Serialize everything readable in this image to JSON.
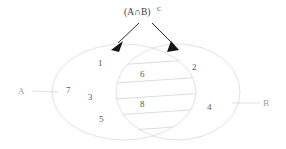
{
  "diagram": {
    "type": "venn-diagram",
    "title": {
      "base": "(A∩B)",
      "superscript": "C",
      "full": "(A∩B)ᶜ"
    },
    "set_labels": {
      "left": "A",
      "right": "B"
    },
    "regions": {
      "left_only": {
        "set": "A only",
        "numbers": [
          "1",
          "7",
          "3",
          "5"
        ]
      },
      "intersection": {
        "set": "A ∩ B",
        "shaded": "hatched",
        "numbers": [
          "6",
          "8"
        ]
      },
      "right_only": {
        "set": "B only",
        "numbers": [
          "2",
          "4"
        ]
      }
    },
    "numbers": [
      {
        "value": "1",
        "x": 98,
        "y": 66,
        "region": "left-only"
      },
      {
        "value": "7",
        "x": 68,
        "y": 93,
        "region": "left-only"
      },
      {
        "value": "3",
        "x": 90,
        "y": 100,
        "region": "left-only"
      },
      {
        "value": "5",
        "x": 100,
        "y": 122,
        "region": "left-only"
      },
      {
        "value": "6",
        "x": 142,
        "y": 77,
        "region": "intersection"
      },
      {
        "value": "8",
        "x": 142,
        "y": 107,
        "region": "intersection"
      },
      {
        "value": "2",
        "x": 194,
        "y": 70,
        "region": "right-only"
      },
      {
        "value": "4",
        "x": 209,
        "y": 110,
        "region": "right-only"
      }
    ],
    "annotations": {
      "arrow_count": 2,
      "arrow_target_left": "A-only boundary",
      "arrow_target_right": "B-only boundary"
    },
    "colors": {
      "outline": "#d2d4d6",
      "hatch": "#c2c4c6",
      "number_text": "#55595c",
      "set_label_text": "#9aa0a4",
      "title_text": "#3a3d40",
      "arrow": "#141414",
      "background": "#ffffff"
    }
  }
}
